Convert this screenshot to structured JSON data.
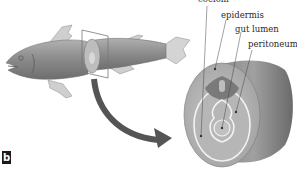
{
  "figure": {
    "panel_label": "b",
    "labels": [
      {
        "id": "coelom",
        "text": "coelom"
      },
      {
        "id": "epidermis",
        "text": "epidermis"
      },
      {
        "id": "gut-lumen",
        "text": "gut lumen"
      },
      {
        "id": "peritoneum",
        "text": "peritoneum"
      }
    ],
    "colors": {
      "body_fill": "#8c8c8c",
      "fin_fill": "#cfcfcf",
      "arrow": "#555555",
      "section_face": "#b8b8b8",
      "membrane": "#f2f2f2",
      "label_text": "#2a2a2a"
    }
  }
}
